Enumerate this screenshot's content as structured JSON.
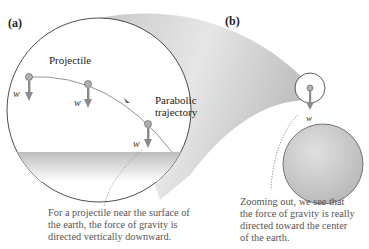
{
  "panels": {
    "a": {
      "label": "(a)"
    },
    "b": {
      "label": "(b)"
    }
  },
  "labels": {
    "projectile": "Projectile",
    "parabolic_line1": "Parabolic",
    "parabolic_line2": "trajectory",
    "weight_vector": "w⃗"
  },
  "captions": {
    "a": {
      "line1": "For a projectile near the surface of",
      "line2": "the earth, the force of gravity is",
      "line3": "directed vertically downward."
    },
    "b": {
      "line1": "Zooming out, we see that",
      "line2": "the force of gravity is really",
      "line3": "directed toward the center",
      "line4": "of the earth."
    }
  },
  "colors": {
    "arrow": "#8a8a8a",
    "ball": "#b0b0b0",
    "earth": "#cfcfcf",
    "outline": "#333333",
    "caption_text": "#555555"
  }
}
